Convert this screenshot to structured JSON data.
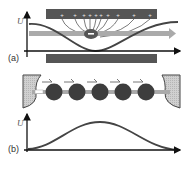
{
  "figure": {
    "panels": [
      {
        "id": "a",
        "label": "(a)",
        "y_axis_label": "U",
        "description": "Single charge between charged electrodes; field lines converge on the negative charge; potential well along channel",
        "charge_sign": "−",
        "plus_count": 10
      },
      {
        "id": "b",
        "label": "(b)",
        "y_axis_label": "U",
        "description": "Chain of particles in a channel between two reservoirs; potential barrier profile",
        "particle_count": 5,
        "charge_sign": "−"
      }
    ],
    "colors": {
      "electrode": "#555555",
      "particle": "#3d3d3d",
      "channel_arrow": "#aaaaaa",
      "curve": "#444444",
      "reservoir": "#c8c8c8",
      "axis": "#111111"
    }
  }
}
